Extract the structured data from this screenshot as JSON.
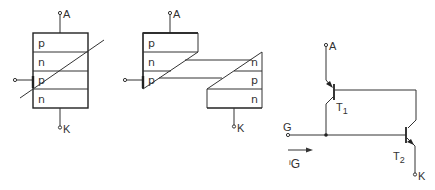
{
  "figure_1": {
    "title": "Four-layer thyristor structure",
    "terminals": {
      "anode": "A",
      "cathode": "K"
    },
    "layers": [
      "p",
      "n",
      "p",
      "n"
    ]
  },
  "figure_2": {
    "title": "Split two-transistor structure",
    "terminals": {
      "anode": "A",
      "cathode": "K"
    },
    "left_layers": [
      "p",
      "n",
      "p"
    ],
    "right_layers": [
      "n",
      "p",
      "n"
    ]
  },
  "figure_3": {
    "title": "Two-transistor equivalent circuit",
    "terminals": {
      "anode": "A",
      "cathode": "K",
      "gate": "G"
    },
    "transistors": [
      {
        "name": "T",
        "sub": "1"
      },
      {
        "name": "T",
        "sub": "2"
      }
    ],
    "gate_current": {
      "symbol": "i",
      "sub": "G"
    }
  },
  "colors": {
    "stroke": "#333333",
    "background": "#ffffff"
  }
}
